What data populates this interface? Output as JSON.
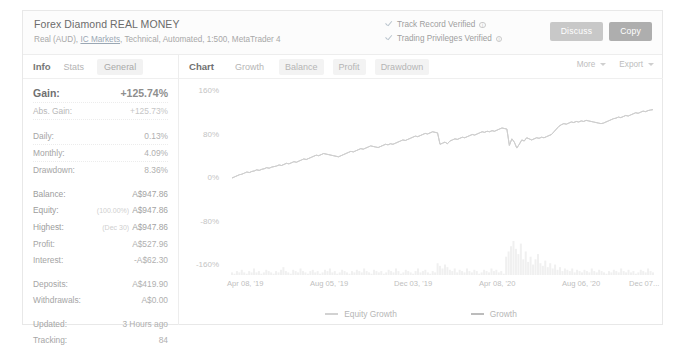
{
  "header": {
    "system_title": "Forex Diamond REAL MONEY",
    "subtitle_prefix": "Real (AUD),",
    "broker_link": "IC Markets",
    "subtitle_rest": ", Technical, Automated, 1:500, MetaTrader 4",
    "verified": [
      {
        "label": "Track Record Verified",
        "icon": "info-icon",
        "check": "check-icon"
      },
      {
        "label": "Trading Privileges Verified",
        "icon": "info-icon",
        "check": "check-icon"
      }
    ],
    "discuss_label": "Discuss",
    "copy_label": "Copy"
  },
  "left_panel": {
    "tabs": [
      {
        "label": "Info",
        "active": true
      },
      {
        "label": "Stats",
        "active": false
      },
      {
        "label": "General",
        "active": false
      }
    ],
    "stats": [
      {
        "key": "Gain:",
        "value": "+125.74%",
        "note": "",
        "style": "gain"
      },
      {
        "key": "Abs. Gain:",
        "value": "+125.73%",
        "note": "",
        "style": "absgain"
      },
      {
        "key": "Daily:",
        "value": "0.13%",
        "note": "",
        "style": "normal"
      },
      {
        "key": "Monthly:",
        "value": "4.09%",
        "note": "",
        "style": "normal"
      },
      {
        "key": "Drawdown:",
        "value": "8.36%",
        "note": "",
        "style": "normal"
      },
      {
        "key": "Balance:",
        "value": "A$947.86",
        "note": "",
        "style": "dark"
      },
      {
        "key": "Equity:",
        "value": "A$947.86",
        "note": "(100.00%)",
        "style": "dark"
      },
      {
        "key": "Highest:",
        "value": "A$947.86",
        "note": "(Dec 30)",
        "style": "dark"
      },
      {
        "key": "Profit:",
        "value": "A$527.96",
        "note": "",
        "style": "normal"
      },
      {
        "key": "Interest:",
        "value": "-A$62.30",
        "note": "",
        "style": "normal"
      },
      {
        "key": "Deposits:",
        "value": "A$419.90",
        "note": "",
        "style": "normal"
      },
      {
        "key": "Withdrawals:",
        "value": "A$0.00",
        "note": "",
        "style": "normal"
      },
      {
        "key": "Updated:",
        "value": "3 Hours ago",
        "note": "",
        "style": "normal"
      },
      {
        "key": "Tracking:",
        "value": "84",
        "note": "",
        "style": "normal"
      }
    ]
  },
  "chart_panel": {
    "tabs": [
      {
        "label": "Chart",
        "active": true
      },
      {
        "label": "Growth",
        "active": false
      },
      {
        "label": "Balance",
        "active": false
      },
      {
        "label": "Profit",
        "active": false
      },
      {
        "label": "Drawdown",
        "active": false
      }
    ],
    "more_label": "More",
    "export_label": "Export"
  },
  "chart_data": {
    "type": "line",
    "title": "",
    "xlabel": "",
    "ylabel": "",
    "ylim": [
      -160,
      160
    ],
    "grid": false,
    "legend_position": "bottom",
    "yticks": [
      "160%",
      "80%",
      "0%",
      "-80%",
      "-160%"
    ],
    "ytick_values": [
      160,
      80,
      0,
      -80,
      -160
    ],
    "xticks": [
      "Apr 08, '19",
      "Aug 05, '19",
      "Dec 03, '19",
      "Apr 08, '20",
      "Aug 06, '20",
      "Dec 07..."
    ],
    "series": [
      {
        "name": "Growth",
        "color": "#b9b9b9",
        "values": [
          0,
          2,
          4,
          6,
          7,
          9,
          11,
          10,
          12,
          13,
          15,
          14,
          16,
          17,
          19,
          18,
          20,
          21,
          22,
          24,
          23,
          25,
          27,
          26,
          28,
          30,
          29,
          31,
          33,
          35,
          34,
          36,
          38,
          40,
          42,
          41,
          43,
          45,
          44,
          43,
          42,
          41,
          40,
          39,
          41,
          43,
          45,
          47,
          49,
          48,
          50,
          52,
          54,
          53,
          55,
          57,
          59,
          58,
          57,
          56,
          58,
          60,
          62,
          61,
          63,
          62,
          64,
          66,
          68,
          70,
          69,
          71,
          73,
          75,
          77,
          76,
          78,
          80,
          82,
          81,
          83,
          85,
          84,
          83,
          62,
          64,
          66,
          63,
          68,
          70,
          72,
          71,
          73,
          75,
          74,
          76,
          78,
          80,
          79,
          81,
          83,
          85,
          84,
          86,
          85,
          87,
          86,
          88,
          90,
          92,
          91,
          90,
          60,
          72,
          66,
          55,
          62,
          70,
          68,
          74,
          72,
          70,
          72,
          74,
          73,
          75,
          74,
          76,
          78,
          80,
          85,
          90,
          95,
          98,
          100,
          99,
          101,
          103,
          102,
          104,
          103,
          105,
          104,
          106,
          105,
          104,
          103,
          102,
          101,
          100,
          101,
          103,
          105,
          107,
          109,
          110,
          112,
          111,
          113,
          115,
          114,
          116,
          118,
          120,
          119,
          121,
          123,
          122,
          124,
          125,
          125.74
        ]
      },
      {
        "name": "Equity Growth",
        "color": "#d0d0d0",
        "values": [
          0,
          2,
          4,
          6,
          7,
          9,
          11,
          10,
          12,
          13,
          15,
          14,
          16,
          17,
          19,
          18,
          20,
          21,
          22,
          24,
          23,
          25,
          27,
          26,
          28,
          30,
          29,
          31,
          33,
          35,
          34,
          36,
          38,
          40,
          42,
          41,
          43,
          45,
          44,
          43,
          42,
          41,
          40,
          39,
          41,
          43,
          45,
          47,
          49,
          48,
          50,
          52,
          54,
          53,
          55,
          57,
          59,
          58,
          57,
          56,
          58,
          60,
          62,
          61,
          63,
          62,
          64,
          66,
          68,
          70,
          69,
          71,
          73,
          75,
          77,
          76,
          78,
          80,
          82,
          81,
          83,
          85,
          84,
          83,
          62,
          64,
          66,
          63,
          68,
          70,
          72,
          71,
          73,
          75,
          74,
          76,
          78,
          80,
          79,
          81,
          83,
          85,
          84,
          86,
          85,
          87,
          86,
          88,
          90,
          92,
          91,
          90,
          60,
          72,
          66,
          55,
          62,
          70,
          68,
          74,
          72,
          70,
          72,
          74,
          73,
          75,
          74,
          76,
          78,
          80,
          85,
          90,
          95,
          98,
          100,
          99,
          101,
          103,
          102,
          104,
          103,
          105,
          104,
          106,
          105,
          104,
          103,
          102,
          101,
          100,
          101,
          103,
          105,
          107,
          109,
          110,
          112,
          111,
          113,
          115,
          114,
          116,
          118,
          120,
          119,
          121,
          123,
          122,
          124,
          125,
          125.74
        ]
      }
    ],
    "volume_bars": {
      "name": "volume",
      "color": "#f0f0f0",
      "values": [
        2,
        1,
        3,
        2,
        4,
        2,
        1,
        3,
        2,
        5,
        2,
        3,
        1,
        2,
        4,
        3,
        2,
        1,
        3,
        2,
        4,
        6,
        3,
        2,
        1,
        4,
        3,
        2,
        5,
        3,
        2,
        1,
        3,
        4,
        2,
        3,
        1,
        2,
        4,
        3,
        5,
        2,
        3,
        1,
        2,
        4,
        3,
        2,
        1,
        3,
        2,
        4,
        3,
        2,
        5,
        3,
        2,
        1,
        4,
        3,
        2,
        3,
        1,
        2,
        4,
        3,
        2,
        5,
        3,
        1,
        2,
        4,
        3,
        2,
        1,
        3,
        5,
        2,
        3,
        4,
        2,
        1,
        3,
        2,
        9,
        7,
        5,
        8,
        6,
        4,
        3,
        5,
        2,
        4,
        3,
        2,
        5,
        3,
        2,
        4,
        3,
        1,
        2,
        4,
        3,
        2,
        5,
        3,
        4,
        2,
        3,
        1,
        14,
        18,
        22,
        26,
        20,
        16,
        24,
        12,
        18,
        10,
        14,
        8,
        12,
        16,
        9,
        7,
        11,
        6,
        9,
        5,
        8,
        4,
        6,
        3,
        5,
        4,
        3,
        5,
        2,
        4,
        3,
        2,
        4,
        3,
        2,
        5,
        3,
        2,
        4,
        3,
        2,
        1,
        3,
        2,
        4,
        3,
        2,
        5,
        3,
        2,
        4,
        2,
        3,
        1,
        2,
        4,
        3,
        2,
        5,
        3,
        2
      ]
    },
    "legend": [
      "Equity Growth",
      "Growth"
    ]
  }
}
